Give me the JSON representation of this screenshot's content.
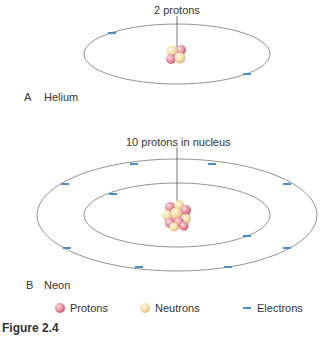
{
  "figure": {
    "caption": "Figure 2.4",
    "panels": [
      {
        "letter": "A",
        "name": "Helium",
        "callout": "2 protons",
        "protons": 2,
        "neutrons": 2,
        "electrons": 2,
        "shells": 1
      },
      {
        "letter": "B",
        "name": "Neon",
        "callout": "10 protons in nucleus",
        "protons": 10,
        "neutrons": 10,
        "electrons": 10,
        "shells": 2
      }
    ],
    "legend": [
      {
        "icon": "proton-sphere-icon",
        "label": "Protons",
        "color": "#e07a8a"
      },
      {
        "icon": "neutron-sphere-icon",
        "label": "Neutrons",
        "color": "#f3dca8"
      },
      {
        "icon": "electron-dash-icon",
        "label": "Electrons",
        "color": "#4a90d0"
      }
    ]
  }
}
